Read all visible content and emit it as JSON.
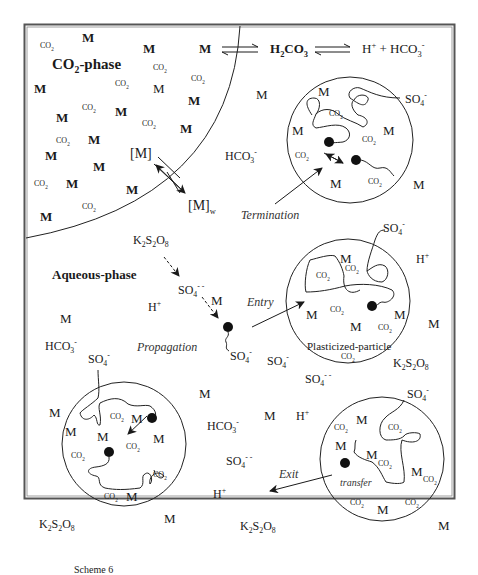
{
  "title": "Scheme 6",
  "phases": {
    "co2_phase": "CO₂-phase",
    "aqueous_phase": "Aqueous-phase"
  },
  "equilibrium": {
    "left": "M",
    "middle": "H₂CO₃",
    "right": "H⁺ + HCO₃⁻"
  },
  "partition": {
    "monomer_co2": "[M]",
    "monomer_water": "[M]w"
  },
  "process_labels": {
    "termination": "Termination",
    "entry": "Entry",
    "propagation": "Propagation",
    "exit": "Exit",
    "transfer": "transfer",
    "particle": "Plasticized-particle"
  },
  "species": {
    "monomer": "M",
    "co2": "CO₂",
    "persulfate": "K₂S₂O₈",
    "sulfate_radical": "SO₄⁻",
    "sulfate_dianion": "SO₄⁻⁻",
    "proton": "H⁺",
    "bicarbonate": "HCO₃⁻"
  },
  "caption": "Scheme 6",
  "colors": {
    "line": "#1a1a1a",
    "border": "#555555",
    "italic_text": "#333333"
  }
}
